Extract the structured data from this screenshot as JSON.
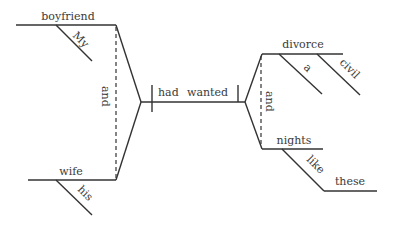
{
  "diagram": {
    "type": "sentence-diagram",
    "sentence": "My boyfriend and his wife had wanted a civil divorce and nights like these",
    "colors": {
      "line": "#333333",
      "text": "#3a3a3a"
    },
    "subject": {
      "conjunction": "and",
      "words": [
        {
          "word": "boyfriend",
          "modifier": "My"
        },
        {
          "word": "wife",
          "modifier": "his"
        }
      ]
    },
    "verb": {
      "auxiliary": "had",
      "main": "wanted"
    },
    "object": {
      "conjunction": "and",
      "words": [
        {
          "word": "divorce",
          "modifiers": [
            "a",
            "civil"
          ]
        },
        {
          "word": "nights",
          "preposition": "like",
          "prep_object": "these"
        }
      ]
    }
  }
}
